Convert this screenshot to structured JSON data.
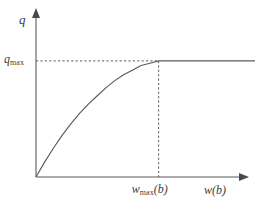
{
  "figure": {
    "background_color": "#ffffff",
    "line_color": "#5a5a5a",
    "text_color": "#3d3d3d",
    "y_axis_label": "q",
    "y_tick_label_base": "q",
    "y_tick_label_sub": "max",
    "x_tick_label_base": "w",
    "x_tick_label_sub": "max",
    "x_tick_label_arg": "(b)",
    "x_axis_label_base": "w",
    "x_axis_label_arg": "(b)"
  },
  "chart_data": {
    "type": "line",
    "title": "",
    "xlabel": "w(b)",
    "ylabel": "q",
    "grid": false,
    "legend": null,
    "xlim": [
      0,
      1.25
    ],
    "ylim": [
      0,
      1.18
    ],
    "annotations": [
      {
        "name": "q-max-tick",
        "axis": "y",
        "value": 1.0,
        "label": "q_max",
        "guide": "dashed-horizontal"
      },
      {
        "name": "w-max-tick",
        "axis": "x",
        "value": 0.7,
        "label": "w_max(b)",
        "guide": "dashed-vertical"
      }
    ],
    "series": [
      {
        "name": "q as a function of w(b)",
        "description": "Concave increasing saturating curve rising from the origin and becoming constant at q_max for w(b) >= w_max(b)",
        "x": [
          0.0,
          0.05,
          0.1,
          0.15,
          0.2,
          0.25,
          0.3,
          0.35,
          0.4,
          0.45,
          0.5,
          0.55,
          0.6,
          0.65,
          0.7,
          0.8,
          0.9,
          1.0,
          1.1,
          1.2,
          1.25
        ],
        "y": [
          0.0,
          0.13,
          0.25,
          0.36,
          0.46,
          0.55,
          0.63,
          0.7,
          0.77,
          0.83,
          0.88,
          0.92,
          0.96,
          0.98,
          1.0,
          1.0,
          1.0,
          1.0,
          1.0,
          1.0,
          1.0
        ]
      }
    ]
  }
}
